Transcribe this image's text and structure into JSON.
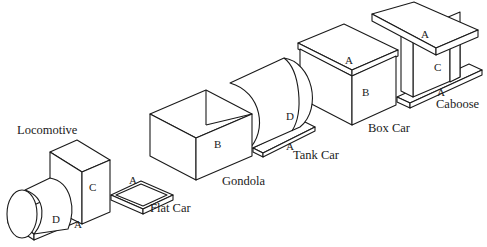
{
  "diagram": {
    "type": "isometric-train",
    "cars": [
      {
        "name": "Locomotive",
        "parts": [
          "A",
          "C",
          "D"
        ]
      },
      {
        "name": "Flat Car",
        "parts": [
          "A"
        ]
      },
      {
        "name": "Gondola",
        "parts": [
          "B"
        ]
      },
      {
        "name": "Tank Car",
        "parts": [
          "A",
          "D"
        ]
      },
      {
        "name": "Box Car",
        "parts": [
          "A",
          "B"
        ]
      },
      {
        "name": "Caboose",
        "parts": [
          "A",
          "C",
          "A"
        ]
      }
    ],
    "captions": {
      "locomotive": "Locomotive",
      "flat_car": "Flat Car",
      "gondola": "Gondola",
      "tank_car": "Tank Car",
      "box_car": "Box Car",
      "caboose": "Caboose"
    },
    "part_labels": {
      "loco_base": "A",
      "loco_cab": "C",
      "loco_boiler": "D",
      "flat_deck": "A",
      "gondola_box": "B",
      "tank_body": "D",
      "tank_base": "A",
      "box_roof": "A",
      "box_body": "B",
      "caboose_roof": "A",
      "caboose_body": "C",
      "caboose_base": "A"
    },
    "colors": {
      "line": "#1a1a1a",
      "background": "#ffffff"
    }
  }
}
